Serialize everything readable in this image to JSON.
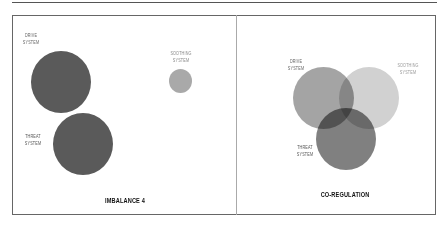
{
  "panels": [
    {
      "title": "IMBALANCE 4",
      "labels": {
        "drive": [
          "DRIVE",
          "SYSTEM"
        ],
        "soothing": [
          "SOOTHING",
          "SYSTEM"
        ],
        "threat": [
          "THREAT",
          "SYSTEM"
        ]
      }
    },
    {
      "title": "CO-REGULATION",
      "labels": {
        "drive": [
          "DRIVE",
          "SYSTEM"
        ],
        "soothing": [
          "SOOTHING",
          "SYSTEM"
        ],
        "threat": [
          "THREAT",
          "SYSTEM"
        ]
      }
    }
  ],
  "colors": {
    "drive": "#5a5a5a",
    "threat": "#5a5a5a",
    "soothing": "#a9a9a9",
    "venn_drive": "#9a9a9a",
    "venn_soothing": "#c4c4c4",
    "venn_threat": "#6a6a6a"
  }
}
